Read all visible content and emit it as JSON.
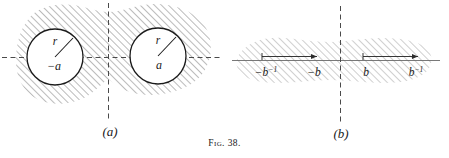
{
  "figure": {
    "caption": "Fig. 38.",
    "panels": [
      {
        "id": "a",
        "label": "(a)",
        "description": "Two disks of radius r centered at -a and a, excluded from a shaded region",
        "axis": {
          "horizontal": "dashed",
          "vertical": "dashed"
        },
        "circles": [
          {
            "name": "left-circle",
            "center_label": "−a",
            "radius_label": "r"
          },
          {
            "name": "right-circle",
            "center_label": "a",
            "radius_label": "r"
          }
        ]
      },
      {
        "id": "b",
        "label": "(b)",
        "description": "Elongated shaded strip about the real axis with two marked intervals",
        "axis": {
          "horizontal": "solid",
          "vertical": "dashed"
        },
        "intervals": [
          {
            "name": "left-interval",
            "start_label": "−b⁻¹",
            "end_label": "−b",
            "start_base": "−b",
            "start_exp": "−1",
            "end_base": "−b",
            "end_exp": ""
          },
          {
            "name": "right-interval",
            "start_label": "b",
            "end_label": "b⁻¹",
            "start_base": "b",
            "start_exp": "",
            "end_base": "b",
            "end_exp": "−1"
          }
        ]
      }
    ]
  },
  "colors": {
    "ink": "#1a1a1a",
    "hatch": "#8d8d8d",
    "hatch_soft": "#b9b9b9",
    "background": "#ffffff"
  }
}
